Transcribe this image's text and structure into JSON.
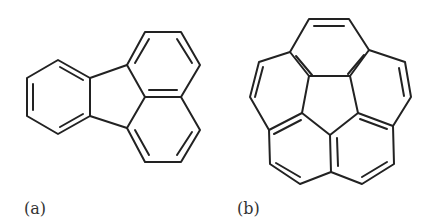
{
  "figure": {
    "panels": [
      {
        "id": "a",
        "label": "(a)",
        "molecule": "fluoranthene"
      },
      {
        "id": "b",
        "label": "(b)",
        "molecule": "corannulene"
      }
    ]
  },
  "colors": {
    "bond": "#222222",
    "background": "#ffffff",
    "label": "#333333"
  }
}
